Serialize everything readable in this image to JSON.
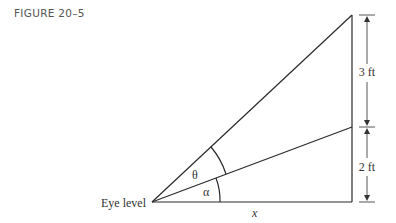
{
  "figure": {
    "caption": "FIGURE 20–5",
    "labels": {
      "eye_level": "Eye level",
      "theta": "θ",
      "alpha": "α",
      "x": "x",
      "upper_dimension": "3 ft",
      "lower_dimension": "2 ft"
    },
    "colors": {
      "line": "#2a2a2a",
      "dimension": "#555555",
      "caption": "#555555"
    }
  }
}
